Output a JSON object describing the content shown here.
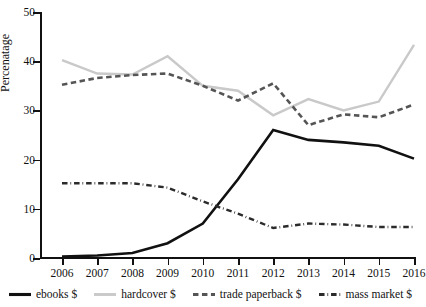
{
  "chart_data": {
    "type": "line",
    "title": "",
    "xlabel": "",
    "ylabel": "Percenatage",
    "x": [
      2006,
      2007,
      2008,
      2009,
      2010,
      2011,
      2012,
      2013,
      2014,
      2015,
      2016
    ],
    "categories": [
      "2006",
      "2007",
      "2008",
      "2009",
      "2010",
      "2011",
      "2012",
      "2013",
      "2014",
      "2015",
      "2016"
    ],
    "xlim": [
      2006,
      2016
    ],
    "ylim": [
      0,
      50
    ],
    "yticks": [
      0,
      10,
      20,
      30,
      40,
      50
    ],
    "ytick_labels": [
      "0",
      "10",
      "20",
      "30",
      "40",
      "50"
    ],
    "grid": false,
    "legend_position": "bottom",
    "series": [
      {
        "name": "ebooks $",
        "color": "#111111",
        "style": "solid",
        "width": 2.6,
        "values": [
          0.3,
          0.5,
          1.0,
          3.0,
          7.0,
          16.0,
          26.0,
          24.0,
          23.5,
          22.8,
          20.2
        ]
      },
      {
        "name": "hardcover $",
        "color": "#c9c9c9",
        "style": "solid",
        "width": 2.4,
        "values": [
          40.2,
          37.5,
          37.3,
          41.0,
          35.0,
          34.0,
          29.0,
          32.3,
          30.0,
          31.8,
          43.3
        ]
      },
      {
        "name": "trade paperback $",
        "color": "#555555",
        "style": "dashed",
        "width": 2.6,
        "values": [
          35.2,
          36.6,
          37.2,
          37.5,
          35.0,
          32.0,
          35.5,
          27.0,
          29.2,
          28.6,
          31.2
        ]
      },
      {
        "name": "mass market $",
        "color": "#2b2b2b",
        "style": "dashdot",
        "width": 2.4,
        "values": [
          15.2,
          15.2,
          15.2,
          14.3,
          11.5,
          9.0,
          6.1,
          7.0,
          6.8,
          6.3,
          6.3
        ]
      }
    ]
  },
  "legend": {
    "items": [
      {
        "label": "ebooks $",
        "sample": "solid-black-line-icon"
      },
      {
        "label": "hardcover $",
        "sample": "solid-gray-line-icon"
      },
      {
        "label": "trade paperback $",
        "sample": "dashed-gray-line-icon"
      },
      {
        "label": "mass market $",
        "sample": "dashdot-black-line-icon"
      }
    ]
  }
}
